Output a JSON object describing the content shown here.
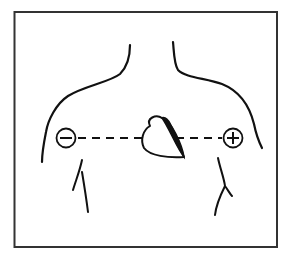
{
  "figure": {
    "negative_electrode": {
      "symbol": "−",
      "label": "negative electrode (right arm side)"
    },
    "positive_electrode": {
      "symbol": "+",
      "label": "positive electrode (left arm side)"
    },
    "heart_label": "heart",
    "lead_axis_label": "lead axis (dashed line)",
    "colors": {
      "ink": "#111111",
      "frame": "#333333",
      "background": "#ffffff"
    }
  }
}
